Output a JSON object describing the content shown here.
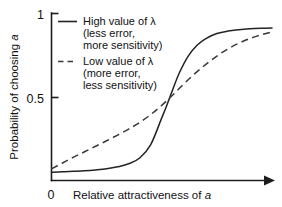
{
  "chart_data": {
    "type": "line",
    "title": "",
    "xlabel": "Relative attractiveness of a",
    "ylabel": "Probability of choosing a",
    "xlabel_italic_tail": "a",
    "ylabel_italic_tail": "a",
    "xlim": [
      0,
      1
    ],
    "ylim": [
      0,
      1
    ],
    "grid": false,
    "x_ticks": [
      "0"
    ],
    "y_ticks": [
      "0",
      "0.5",
      "1"
    ],
    "y_tick_values": [
      0,
      0.5,
      1
    ],
    "x_axis_arrow": true,
    "legend_position": "inside-top-left",
    "series": [
      {
        "name": "High value of λ",
        "style": "solid",
        "color": "#232323",
        "legend_lines": [
          "High value of λ",
          "(less error,",
          "more sensitivity)"
        ],
        "x": [
          0.0,
          0.05,
          0.1,
          0.15,
          0.2,
          0.25,
          0.3,
          0.35,
          0.4,
          0.45,
          0.5,
          0.52,
          0.55,
          0.58,
          0.62,
          0.66,
          0.7,
          0.75,
          0.8,
          0.85,
          0.9,
          0.95,
          1.0
        ],
        "values": [
          0.05,
          0.052,
          0.055,
          0.058,
          0.063,
          0.07,
          0.082,
          0.1,
          0.135,
          0.215,
          0.375,
          0.44,
          0.545,
          0.645,
          0.745,
          0.81,
          0.85,
          0.88,
          0.895,
          0.903,
          0.908,
          0.911,
          0.913
        ]
      },
      {
        "name": "Low value of λ",
        "style": "dashed",
        "color": "#3a3a3a",
        "legend_lines": [
          "Low value of λ",
          "(more error,",
          "less sensitivity)"
        ],
        "x": [
          0.0,
          0.05,
          0.1,
          0.15,
          0.2,
          0.25,
          0.3,
          0.35,
          0.4,
          0.45,
          0.5,
          0.55,
          0.6,
          0.65,
          0.7,
          0.75,
          0.8,
          0.85,
          0.9,
          0.95,
          1.0
        ],
        "values": [
          0.07,
          0.105,
          0.14,
          0.172,
          0.205,
          0.238,
          0.272,
          0.308,
          0.348,
          0.395,
          0.45,
          0.512,
          0.578,
          0.64,
          0.695,
          0.745,
          0.788,
          0.822,
          0.85,
          0.872,
          0.89
        ]
      }
    ],
    "crossover_point": {
      "x": 0.555,
      "y": 0.5
    }
  }
}
